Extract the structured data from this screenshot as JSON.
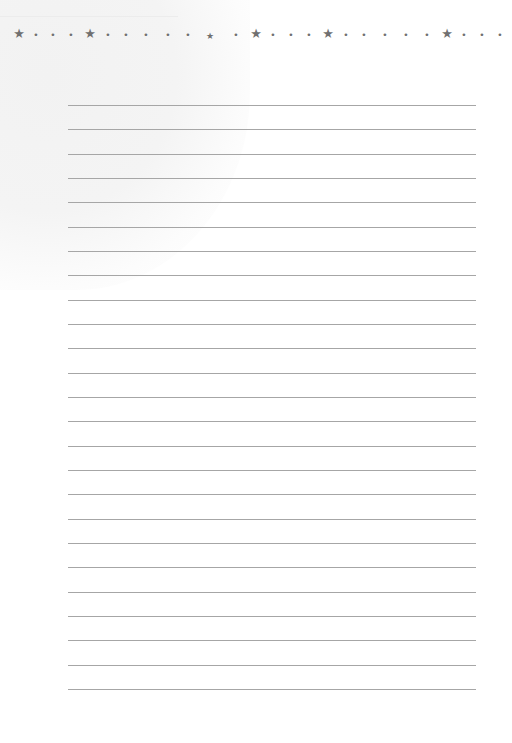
{
  "page": {
    "background": "#ffffff",
    "rule_color": "#a6a6a6",
    "ornament_color": "#707070"
  },
  "border": {
    "y": 34,
    "ornaments": [
      {
        "type": "star",
        "x": 19
      },
      {
        "type": "dot",
        "x": 36
      },
      {
        "type": "dot",
        "x": 53
      },
      {
        "type": "dot",
        "x": 71
      },
      {
        "type": "star",
        "x": 90
      },
      {
        "type": "dot",
        "x": 108
      },
      {
        "type": "dot",
        "x": 126
      },
      {
        "type": "dot",
        "x": 146
      },
      {
        "type": "dot",
        "x": 168
      },
      {
        "type": "dot",
        "x": 188
      },
      {
        "type": "star-small",
        "x": 210
      },
      {
        "type": "dot",
        "x": 236
      },
      {
        "type": "star",
        "x": 256
      },
      {
        "type": "dot",
        "x": 273
      },
      {
        "type": "dot",
        "x": 291
      },
      {
        "type": "dot",
        "x": 309
      },
      {
        "type": "star",
        "x": 328
      },
      {
        "type": "dot",
        "x": 346
      },
      {
        "type": "dot",
        "x": 364
      },
      {
        "type": "dot",
        "x": 385
      },
      {
        "type": "dot",
        "x": 406
      },
      {
        "type": "dot",
        "x": 427
      },
      {
        "type": "star",
        "x": 447
      },
      {
        "type": "dot",
        "x": 464
      },
      {
        "type": "dot",
        "x": 482
      },
      {
        "type": "dot",
        "x": 500
      }
    ]
  },
  "ruled_lines": {
    "count": 25,
    "first_y": 105,
    "spacing": 24.33,
    "left": 68,
    "right": 476
  }
}
